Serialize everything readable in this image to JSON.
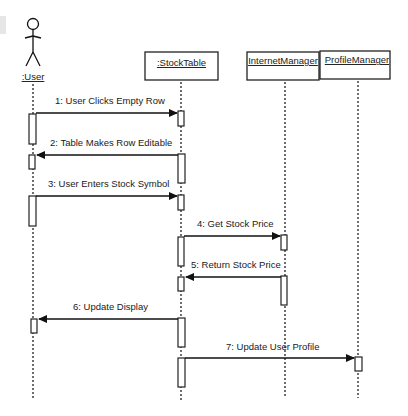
{
  "diagram": {
    "type": "uml-sequence",
    "participants": [
      {
        "id": "user",
        "label": ":User",
        "kind": "actor"
      },
      {
        "id": "stocktable",
        "label": ":StockTable",
        "kind": "object"
      },
      {
        "id": "internetmanager",
        "label": "InternetManager",
        "kind": "object"
      },
      {
        "id": "profilemanager",
        "label": "ProfileManager",
        "kind": "object"
      }
    ],
    "messages": [
      {
        "n": 1,
        "label": "1: User Clicks Empty Row",
        "from": "user",
        "to": "stocktable"
      },
      {
        "n": 2,
        "label": "2: Table Makes Row Editable",
        "from": "stocktable",
        "to": "user"
      },
      {
        "n": 3,
        "label": "3: User Enters Stock Symbol",
        "from": "user",
        "to": "stocktable"
      },
      {
        "n": 4,
        "label": "4: Get Stock Price",
        "from": "stocktable",
        "to": "internetmanager"
      },
      {
        "n": 5,
        "label": "5: Return Stock Price",
        "from": "internetmanager",
        "to": "stocktable"
      },
      {
        "n": 6,
        "label": "6: Update Display",
        "from": "stocktable",
        "to": "user"
      },
      {
        "n": 7,
        "label": "7: Update User Profile",
        "from": "stocktable",
        "to": "profilemanager"
      }
    ],
    "colors": {
      "line": "#111111",
      "background": "#ffffff"
    }
  }
}
